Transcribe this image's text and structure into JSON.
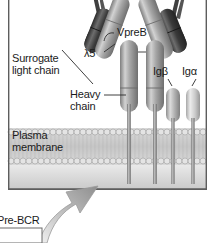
{
  "figure": {
    "type": "biology-diagram"
  },
  "labels": {
    "vpreb": "VpreB",
    "lambda5": "λ5",
    "surrogate_light_chain": "Surrogate\nlight chain",
    "heavy_chain": "Heavy\nchain",
    "ig_beta": "Igβ",
    "ig_alpha": "Igα",
    "plasma_membrane": "Plasma\nmembrane",
    "pre_bcr": "Pre-BCR"
  },
  "colors": {
    "background": "#ffffff",
    "panel_top": "#ffffff",
    "cytoplasm": "#d8d8d8",
    "membrane_band": "#cfcfcf",
    "membrane_head": "#dedede",
    "dark_chain": "#3a3a3a",
    "heavy_chain": "#9a9a9a",
    "ig_capsule": "#b4b4b4",
    "arrow": "#a8a8a8",
    "border": "#5a5a5a",
    "text": "#1b1b1b"
  },
  "structures": {
    "surrogate_light_chain_parts": [
      "VpreB",
      "λ5"
    ],
    "heavy_chains": 2,
    "signaling_subunits": [
      "Igβ",
      "Igα"
    ],
    "membrane": "lipid bilayer"
  }
}
